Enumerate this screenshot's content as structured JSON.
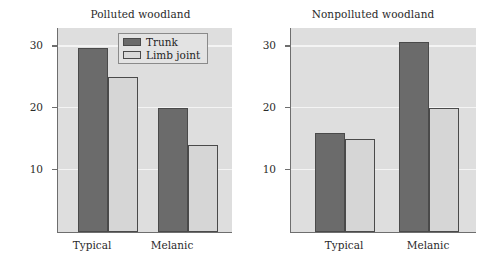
{
  "figure": {
    "background_color": "#ffffff",
    "plot_background_color": "#dedede",
    "gridline_color": "#f4f4f4",
    "axis_color": "#6e6e6e"
  },
  "legend": {
    "position": "top-right of left panel",
    "entries": [
      {
        "label": "Trunk",
        "color": "#6b6b6b",
        "icon": "legend-swatch-filled"
      },
      {
        "label": "Limb joint",
        "color": "#d9d9d9",
        "icon": "legend-swatch-outline"
      }
    ]
  },
  "panels": [
    {
      "id": "polluted",
      "title": "Polluted woodland",
      "ylabel": "Number eaten (of 50 presented)",
      "yticks": [
        10,
        20,
        30
      ],
      "categories": [
        "Typical",
        "Melanic"
      ]
    },
    {
      "id": "nonpolluted",
      "title": "Nonpolluted woodland",
      "ylabel": "",
      "yticks": [
        10,
        20,
        30
      ],
      "categories": [
        "Typical",
        "Melanic"
      ]
    }
  ],
  "chart_data": [
    {
      "type": "bar",
      "title": "Polluted woodland",
      "xlabel": "",
      "ylabel": "Number eaten (of 50 presented)",
      "categories": [
        "Typical",
        "Melanic"
      ],
      "series": [
        {
          "name": "Trunk",
          "values": [
            29.7,
            20
          ],
          "color": "#6b6b6b"
        },
        {
          "name": "Limb joint",
          "values": [
            25,
            14
          ],
          "color": "#d6d6d6"
        }
      ],
      "ylim": [
        0,
        33
      ],
      "yticks": [
        10,
        20,
        30
      ],
      "grid": true,
      "legend": "top-right"
    },
    {
      "type": "bar",
      "title": "Nonpolluted woodland",
      "xlabel": "",
      "ylabel": "",
      "categories": [
        "Typical",
        "Melanic"
      ],
      "series": [
        {
          "name": "Trunk",
          "values": [
            16,
            30.8
          ],
          "color": "#6b6b6b"
        },
        {
          "name": "Limb joint",
          "values": [
            15,
            20
          ],
          "color": "#d6d6d6"
        }
      ],
      "ylim": [
        0,
        33
      ],
      "yticks": [
        10,
        20,
        30
      ],
      "grid": true,
      "legend": "none"
    }
  ]
}
